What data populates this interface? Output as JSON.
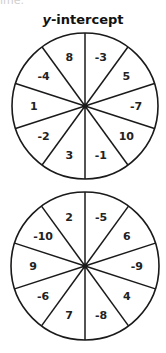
{
  "header": {
    "fragment": "ime.",
    "title_var": "y",
    "title_rest": "-intercept"
  },
  "spinners": [
    {
      "name": "spinner-top",
      "sectors": [
        "-3",
        "5",
        "-7",
        "10",
        "-1",
        "3",
        "-2",
        "1",
        "-4",
        "8"
      ]
    },
    {
      "name": "spinner-bottom",
      "sectors": [
        "-5",
        "6",
        "-9",
        "4",
        "-8",
        "7",
        "-6",
        "9",
        "-10",
        "2"
      ]
    }
  ],
  "colors": {
    "stroke": "#1a1a1a",
    "fill": "#ffffff",
    "text": "#222222"
  }
}
